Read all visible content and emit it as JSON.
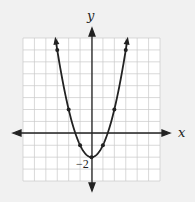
{
  "chart_data": {
    "type": "line",
    "title": "",
    "xlabel": "x",
    "ylabel": "y",
    "xlim": [
      -6,
      6
    ],
    "ylim": [
      -4,
      8
    ],
    "grid": true,
    "function": "y = x^2 - 2",
    "annotations": [
      {
        "text": "−2",
        "at": [
          0,
          -2
        ]
      }
    ],
    "series": [
      {
        "name": "parabola",
        "points": [
          [
            -3.16,
            8
          ],
          [
            -3,
            7
          ],
          [
            -2,
            2
          ],
          [
            -1,
            -1
          ],
          [
            0,
            -2
          ],
          [
            1,
            -1
          ],
          [
            2,
            2
          ],
          [
            3,
            7
          ],
          [
            3.16,
            8
          ]
        ]
      }
    ],
    "marked_points": [
      [
        -3,
        7
      ],
      [
        -2,
        2
      ],
      [
        -1,
        -1
      ],
      [
        0,
        -2
      ],
      [
        1,
        -1
      ],
      [
        2,
        2
      ],
      [
        3,
        7
      ]
    ]
  },
  "labels": {
    "x_axis": "x",
    "y_axis": "y",
    "vertex": "−2"
  },
  "colors": {
    "background": "#f1f1f1",
    "grid_bg": "#ffffff",
    "grid": "#c8c8c8",
    "curve": "#222222"
  }
}
